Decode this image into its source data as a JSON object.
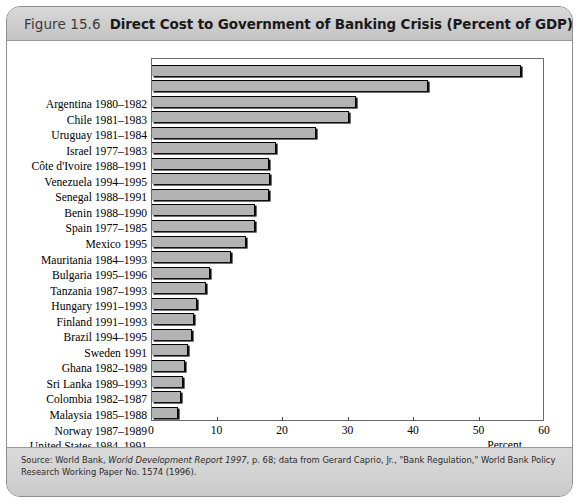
{
  "figure": {
    "number": "Figure 15.6",
    "title": "Direct Cost to Government of Banking Crisis (Percent of GDP)"
  },
  "source": {
    "prefix": "Source: World Bank, ",
    "italic_title": "World Development Report 1997",
    "suffix": ", p. 68; data from Gerard Caprio, Jr., \"Bank Regulation,\" World Bank Policy Research Working Paper No. 1574 (1996)."
  },
  "chart_data": {
    "type": "bar",
    "orientation": "horizontal",
    "title": "Direct Cost to Government of Banking Crisis (Percent of GDP)",
    "xlabel": "Percent",
    "ylabel": "",
    "xlim": [
      0,
      60
    ],
    "xticks": [
      0,
      10,
      20,
      30,
      40,
      50,
      60
    ],
    "grid": false,
    "legend": "none",
    "bar_color": "#b3b3b3",
    "categories": [
      "Argentina 1980–1982",
      "Chile 1981–1983",
      "Uruguay 1981–1984",
      "Israel 1977–1983",
      "Côte d'Ivoire 1988–1991",
      "Venezuela 1994–1995",
      "Senegal 1988–1991",
      "Benin 1988–1990",
      "Spain 1977–1985",
      "Mexico 1995",
      "Mauritania 1984–1993",
      "Bulgaria 1995–1996",
      "Tanzania 1987–1993",
      "Hungary 1991–1993",
      "Finland 1991–1993",
      "Brazil 1994–1995",
      "Sweden 1991",
      "Ghana 1982–1989",
      "Sri Lanka 1989–1993",
      "Colombia 1982–1987",
      "Malaysia 1985–1988",
      "Norway 1987–1989",
      "United States 1984–1991"
    ],
    "values": [
      56.3,
      42.2,
      31.2,
      30.0,
      25.0,
      18.9,
      17.9,
      18.0,
      17.8,
      15.8,
      15.7,
      14.4,
      12.0,
      8.8,
      8.2,
      6.8,
      6.4,
      6.1,
      5.5,
      5.1,
      4.8,
      4.5,
      3.9
    ]
  }
}
